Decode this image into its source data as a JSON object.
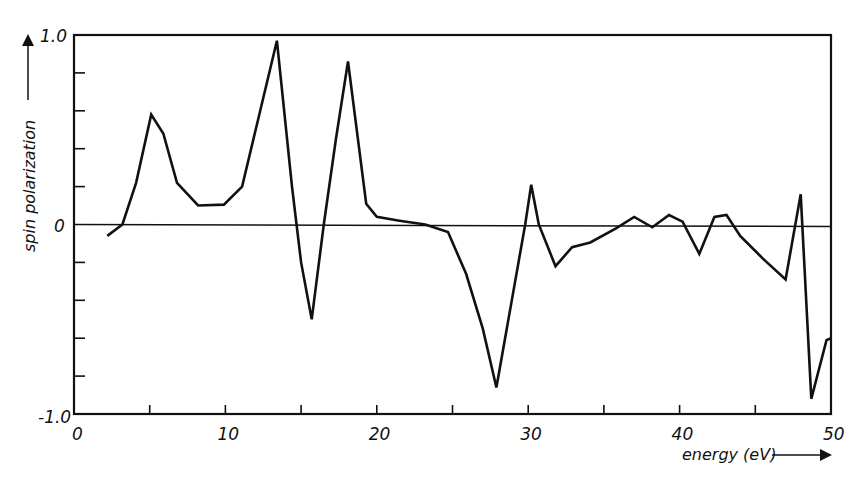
{
  "chart_data": {
    "type": "line",
    "title": "",
    "xlabel": "energy (eV)",
    "ylabel": "spin polarization",
    "xlim": [
      0,
      50
    ],
    "ylim": [
      -1.0,
      1.0
    ],
    "x_ticks": [
      0,
      5,
      10,
      15,
      20,
      25,
      30,
      35,
      40,
      45,
      50
    ],
    "x_tick_labels": [
      "0",
      "10",
      "20",
      "30",
      "40",
      "50"
    ],
    "x_tick_label_values": [
      0,
      10,
      20,
      30,
      40,
      50
    ],
    "y_ticks": [
      -1.0,
      -0.8,
      -0.6,
      -0.4,
      -0.2,
      0,
      0.2,
      0.4,
      0.6,
      0.8,
      1.0
    ],
    "y_tick_labels": [
      "1.0",
      "0",
      "-1.0"
    ],
    "y_tick_label_values": [
      1.0,
      0,
      -1.0
    ],
    "grid": false,
    "legend": null,
    "zero_line": true,
    "series": [
      {
        "name": "spin polarization",
        "x": [
          2.2,
          3.2,
          4.1,
          5.1,
          5.9,
          6.8,
          8.2,
          9.9,
          11.1,
          12.3,
          13.4,
          14.4,
          15.0,
          15.7,
          16.5,
          17.3,
          18.1,
          19.3,
          20.0,
          21.5,
          23.2,
          24.7,
          25.9,
          27.0,
          27.9,
          29.8,
          30.2,
          30.7,
          31.8,
          32.9,
          34.1,
          35.8,
          37.0,
          38.2,
          39.3,
          40.2,
          41.3,
          42.3,
          43.1,
          44.0,
          45.5,
          47.0,
          48.0,
          48.7,
          49.7,
          50.0
        ],
        "y": [
          -0.06,
          0.0,
          0.22,
          0.58,
          0.48,
          0.22,
          0.1,
          0.105,
          0.2,
          0.6,
          0.97,
          0.2,
          -0.2,
          -0.5,
          0.0,
          0.45,
          0.86,
          0.11,
          0.04,
          0.02,
          0.0,
          -0.04,
          -0.26,
          -0.55,
          -0.86,
          0.0,
          0.21,
          0.0,
          -0.22,
          -0.12,
          -0.095,
          -0.02,
          0.04,
          -0.015,
          0.05,
          0.015,
          -0.155,
          0.04,
          0.05,
          -0.06,
          -0.18,
          -0.29,
          0.16,
          -0.92,
          -0.61,
          -0.6
        ]
      }
    ]
  },
  "axes": {
    "ylabel": "spin polarization",
    "xlabel": "energy (eV)",
    "y_top_label": "1.0",
    "y_zero_label": "0",
    "y_bottom_label": "-1.0",
    "x_labels": [
      "0",
      "10",
      "20",
      "30",
      "40",
      "50"
    ]
  },
  "style": {
    "line_color": "#111111",
    "axis_color": "#111111",
    "background": "#ffffff"
  }
}
